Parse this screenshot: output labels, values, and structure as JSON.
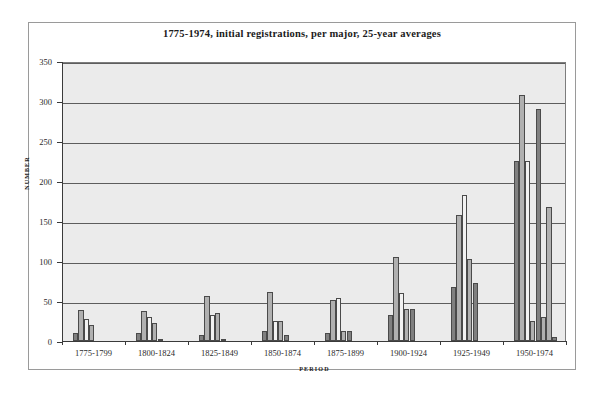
{
  "chart_data": {
    "type": "bar",
    "title": "1775-1974, initial registrations, per major, 25-year averages",
    "xlabel": "PERIOD",
    "ylabel": "NUMBER",
    "ylim": [
      0,
      350
    ],
    "ytick_step": 50,
    "yticks": [
      0,
      50,
      100,
      150,
      200,
      250,
      300,
      350
    ],
    "grid": true,
    "legend": "none",
    "categories": [
      "1775-1799",
      "1800-1824",
      "1825-1849",
      "1850-1874",
      "1875-1899",
      "1900-1924",
      "1925-1949",
      "1950-1974"
    ],
    "series": [
      {
        "name": "series-1",
        "color": "#808080",
        "values": [
          10,
          10,
          8,
          12,
          10,
          32,
          67,
          225
        ]
      },
      {
        "name": "series-2",
        "color": "#b0b0b0",
        "values": [
          39,
          37,
          56,
          61,
          51,
          105,
          157,
          308
        ]
      },
      {
        "name": "series-3",
        "color": "#f2f2f2",
        "values": [
          28,
          30,
          33,
          25,
          54,
          60,
          182,
          225
        ]
      },
      {
        "name": "series-4",
        "color": "#b0b0b0",
        "values": [
          20,
          23,
          35,
          25,
          12,
          40,
          102,
          25
        ]
      },
      {
        "name": "series-5",
        "color": "#808080",
        "values": [
          0,
          1,
          2,
          8,
          12,
          40,
          72,
          290
        ]
      },
      {
        "name": "series-6",
        "color": "#b0b0b0",
        "values": [
          0,
          0,
          0,
          0,
          0,
          0,
          0,
          30
        ]
      },
      {
        "name": "series-7",
        "color": "#b0b0b0",
        "values": [
          0,
          0,
          0,
          0,
          0,
          0,
          0,
          167
        ]
      },
      {
        "name": "series-8",
        "color": "#808080",
        "values": [
          0,
          0,
          0,
          0,
          0,
          0,
          0,
          5
        ]
      }
    ],
    "colors": {
      "plot_background": "#ebebeb",
      "figure_background": "#ffffff",
      "gridline": "#5d5d5d",
      "axis": "#3a3a3a",
      "bar_dark": "#808080",
      "bar_mid": "#b0b0b0",
      "bar_light": "#f2f2f2"
    }
  }
}
